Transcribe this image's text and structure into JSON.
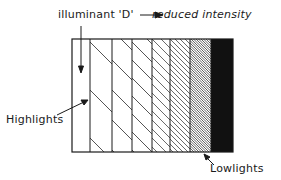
{
  "diagram": {
    "title_left": "illuminant 'D'",
    "title_right": "reduced intensity",
    "label_highlights": "Highlights",
    "label_lowlights": "Lowlights",
    "arrow_direction": "left-to-right",
    "columns": [
      {
        "index": 0,
        "fill": "white",
        "hatch_spacing": 0
      },
      {
        "index": 1,
        "fill": "hatch",
        "hatch_spacing": 48
      },
      {
        "index": 2,
        "fill": "hatch",
        "hatch_spacing": 30
      },
      {
        "index": 3,
        "fill": "hatch",
        "hatch_spacing": 18
      },
      {
        "index": 4,
        "fill": "hatch",
        "hatch_spacing": 9
      },
      {
        "index": 5,
        "fill": "hatch",
        "hatch_spacing": 5
      },
      {
        "index": 6,
        "fill": "hatch",
        "hatch_spacing": 2.5
      },
      {
        "index": 7,
        "fill": "solid",
        "hatch_spacing": 0
      }
    ],
    "colors": {
      "ink": "#1a1a1a",
      "paper": "#ffffff"
    }
  }
}
